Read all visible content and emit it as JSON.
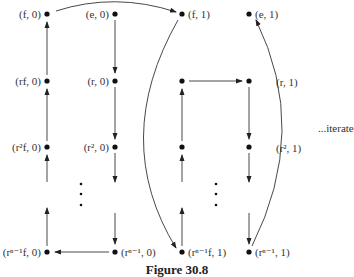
{
  "figure": {
    "caption": "Figure 30.8",
    "side_note": "...iterate"
  },
  "nodes": [
    {
      "id": "f0",
      "label": "(f, 0)",
      "x": 47,
      "y": 14,
      "label_side": "left"
    },
    {
      "id": "e0",
      "label": "(e, 0)",
      "x": 115,
      "y": 14,
      "label_side": "left"
    },
    {
      "id": "f1",
      "label": "(f, 1)",
      "x": 182,
      "y": 14,
      "label_side": "right"
    },
    {
      "id": "e1",
      "label": "(e, 1)",
      "x": 249,
      "y": 14,
      "label_side": "right"
    },
    {
      "id": "rf0",
      "label": "(rf, 0)",
      "x": 47,
      "y": 81,
      "label_side": "left"
    },
    {
      "id": "r0",
      "label": "(r, 0)",
      "x": 115,
      "y": 81,
      "label_side": "left"
    },
    {
      "id": "rf1",
      "label": "",
      "x": 182,
      "y": 81
    },
    {
      "id": "r1",
      "label": "",
      "x": 249,
      "y": 81
    },
    {
      "id": "r2f0",
      "label": "(r²f, 0)",
      "x": 47,
      "y": 147,
      "label_side": "left"
    },
    {
      "id": "r20",
      "label": "(r², 0)",
      "x": 115,
      "y": 147,
      "label_side": "left"
    },
    {
      "id": "r2f1",
      "label": "",
      "x": 182,
      "y": 147
    },
    {
      "id": "r21",
      "label": "",
      "x": 249,
      "y": 147
    },
    {
      "id": "rn1f0",
      "label": "(rⁿ⁻¹f, 0)",
      "x": 47,
      "y": 252,
      "label_side": "left"
    },
    {
      "id": "rn10",
      "label": "(rⁿ⁻¹, 0)",
      "x": 115,
      "y": 252,
      "label_side": "right"
    },
    {
      "id": "rn1f1",
      "label": "(rⁿ⁻¹f, 1)",
      "x": 182,
      "y": 252,
      "label_side": "right"
    },
    {
      "id": "rn11",
      "label": "(rⁿ⁻¹, 1)",
      "x": 249,
      "y": 252,
      "label_side": "right"
    }
  ],
  "curve_labels": [
    {
      "label": "(r, 1)",
      "x": 276,
      "y": 76
    },
    {
      "label": "(r², 1)",
      "x": 276,
      "y": 142
    }
  ],
  "edges": [
    {
      "from": "f0",
      "to": "f1",
      "type": "arc"
    },
    {
      "from": "e0",
      "to": "r0",
      "type": "straight"
    },
    {
      "from": "r0",
      "to": "r20",
      "type": "straight"
    },
    {
      "from": "r20",
      "to": "rn10",
      "type": "straight-broken"
    },
    {
      "from": "rn10",
      "to": "rn1f0",
      "type": "straight"
    },
    {
      "from": "rn1f0",
      "to": "r2f0",
      "type": "straight-broken"
    },
    {
      "from": "r2f0",
      "to": "rf0",
      "type": "straight"
    },
    {
      "from": "rf0",
      "to": "f0",
      "type": "straight"
    },
    {
      "from": "f1",
      "to": "rn1f1",
      "type": "arc"
    },
    {
      "from": "rn1f1",
      "to": "r2f1",
      "type": "straight-broken"
    },
    {
      "from": "r2f1",
      "to": "rf1",
      "type": "straight"
    },
    {
      "from": "rf1",
      "to": "r1",
      "type": "straight"
    },
    {
      "from": "r1",
      "to": "r21",
      "type": "straight"
    },
    {
      "from": "r21",
      "to": "rn11",
      "type": "straight-broken"
    },
    {
      "from": "rn11",
      "to": "e1",
      "type": "arc"
    }
  ],
  "ellipsis_dots": [
    {
      "x": 81,
      "y": 184
    },
    {
      "x": 81,
      "y": 194
    },
    {
      "x": 81,
      "y": 205
    },
    {
      "x": 216,
      "y": 184
    },
    {
      "x": 216,
      "y": 194
    },
    {
      "x": 216,
      "y": 205
    }
  ],
  "colors": {
    "ink": "#222222",
    "background": "#ffffff"
  }
}
